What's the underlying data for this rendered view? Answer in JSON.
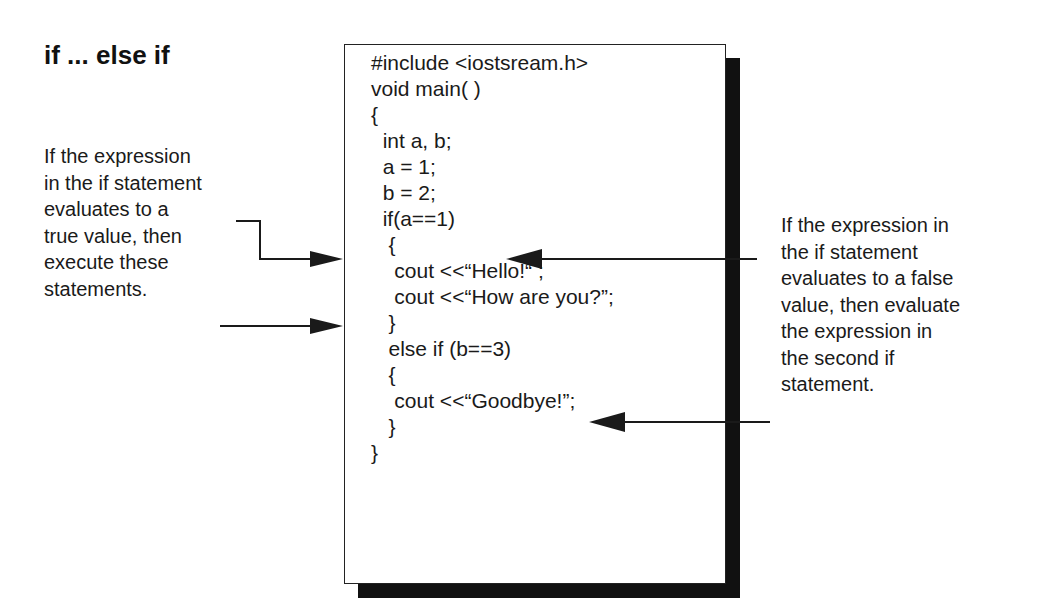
{
  "title": "if ... else if",
  "code": {
    "lines": [
      "#include <iostsream.h>",
      "void main( )",
      "{",
      "  int a, b;",
      "  a = 1;",
      "  b = 2;",
      "  if(a==1)",
      "   {",
      "    cout <<“Hello!“ ;",
      "    cout <<“How are you?”;",
      "   }",
      "   else if (b==3)",
      "   {",
      "    cout <<“Goodbye!”;",
      "   }",
      "}"
    ]
  },
  "left_note": {
    "lines": [
      "If the expression",
      "in the if statement",
      "evaluates to a",
      "true value, then",
      "execute these",
      "statements."
    ]
  },
  "right_note": {
    "lines": [
      "If the expression in",
      "the if statement",
      "evaluates to a false",
      "value, then evaluate",
      "the expression in",
      "the second if",
      "statement."
    ]
  },
  "colors": {
    "background": "#ffffff",
    "ink": "#1a1a1a",
    "shadow": "#111111"
  }
}
